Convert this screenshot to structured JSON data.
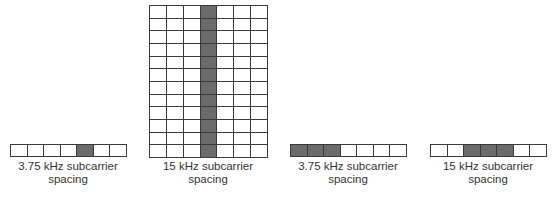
{
  "colors": {
    "filled": "#6b6b6b",
    "empty": "#ffffff",
    "grid_line": "#3a3a3a",
    "text": "#333333"
  },
  "panels": [
    {
      "label_line1": "3.75 kHz subcarrier",
      "label_line2": "spacing",
      "rows": 1,
      "cols": 7,
      "filled_cells": [
        [
          0,
          4
        ]
      ]
    },
    {
      "label_line1": "15 kHz subcarrier",
      "label_line2": "spacing",
      "rows": 12,
      "cols": 7,
      "filled_cells": [
        [
          0,
          3
        ],
        [
          1,
          3
        ],
        [
          2,
          3
        ],
        [
          3,
          3
        ],
        [
          4,
          3
        ],
        [
          5,
          3
        ],
        [
          6,
          3
        ],
        [
          7,
          3
        ],
        [
          8,
          3
        ],
        [
          9,
          3
        ],
        [
          10,
          3
        ],
        [
          11,
          3
        ]
      ]
    },
    {
      "label_line1": "3.75 kHz subcarrier",
      "label_line2": "spacing",
      "rows": 1,
      "cols": 7,
      "filled_cells": [
        [
          0,
          0
        ],
        [
          0,
          1
        ],
        [
          0,
          2
        ]
      ]
    },
    {
      "label_line1": "15 kHz subcarrier",
      "label_line2": "spacing",
      "rows": 1,
      "cols": 7,
      "filled_cells": [
        [
          0,
          2
        ],
        [
          0,
          3
        ],
        [
          0,
          4
        ]
      ]
    }
  ]
}
